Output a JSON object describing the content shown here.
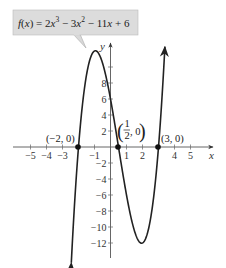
{
  "chart_data": {
    "type": "line",
    "function": "2x^3 - 3x^2 - 11x + 6",
    "xlabel": "x",
    "ylabel": "y",
    "xlim": [
      -6,
      6.5
    ],
    "ylim": [
      -14,
      12.5
    ],
    "x_ticks": [
      -5,
      -4,
      -3,
      -2,
      -1,
      1,
      2,
      3,
      4,
      5
    ],
    "x_tick_labels": [
      "−5",
      "−4",
      "−3",
      "",
      "−1",
      "1",
      "2",
      "",
      "4",
      "5"
    ],
    "y_ticks": [
      -12,
      -10,
      -8,
      -6,
      -4,
      -2,
      2,
      4,
      6,
      8,
      10
    ],
    "y_tick_labels": [
      "−12",
      "−10",
      "−8",
      "−6",
      "−4",
      "−2",
      "2",
      "4",
      "6",
      "8",
      ""
    ],
    "grid": false,
    "series": [
      {
        "name": "f(x) = 2x³ − 3x² − 11x + 6",
        "x_range": [
          -2.45,
          3.4
        ],
        "local_max": {
          "x": -0.94,
          "y": 12.03
        },
        "local_min": {
          "x": 1.94,
          "y": -12.03
        }
      }
    ],
    "points": [
      {
        "x": -2,
        "y": 0,
        "label": "(−2, 0)"
      },
      {
        "x": 0.5,
        "y": 0,
        "label": "(1/2, 0)"
      },
      {
        "x": 3,
        "y": 0,
        "label": "(3, 0)"
      }
    ]
  },
  "callout": {
    "prefix": "f(x) = 2x",
    "exp1": "3",
    "mid": " − 3x",
    "exp2": "2",
    "suffix": " − 11x + 6"
  },
  "axes": {
    "x_name": "x",
    "y_name": "y"
  },
  "labels": {
    "pt1": "(−2, 0)",
    "pt2_num": "1",
    "pt2_den": "2",
    "pt2_rest": ", 0",
    "pt3": "(3, 0)"
  }
}
